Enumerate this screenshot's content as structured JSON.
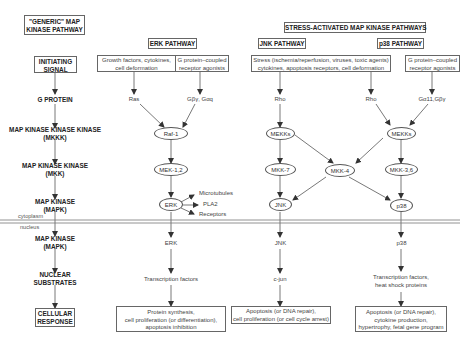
{
  "headers": {
    "generic": "\"GENERIC\" MAP\nKINASE PATHWAY",
    "generic_l1": "\"GENERIC\" MAP",
    "generic_l2": "KINASE PATHWAY",
    "stress": "STRESS-ACTIVATED MAP KINASE PATHWAYS",
    "erk": "ERK PATHWAY",
    "jnk": "JNK PATHWAY",
    "p38": "p38 PATHWAY"
  },
  "generic_steps": {
    "initiating_l1": "INITIATING",
    "initiating_l2": "SIGNAL",
    "g_protein": "G PROTEIN",
    "mkkk_l1": "MAP KINASE KINASE KINASE",
    "mkkk_l2": "(MKKK)",
    "mkk_l1": "MAP KINASE KINASE",
    "mkk_l2": "(MKK)",
    "mapk_l1": "MAP KINASE",
    "mapk_l2": "(MAPK)",
    "mapk2_l1": "MAP KINASE",
    "mapk2_l2": "(MAPK)",
    "nuclear_l1": "NUCLEAR",
    "nuclear_l2": "SUBSTRATES",
    "response_l1": "CELLULAR",
    "response_l2": "RESPONSE"
  },
  "compartments": {
    "cytoplasm": "cytoplasm",
    "nucleus": "nucleus"
  },
  "erk": {
    "signal1_l1": "Growth factors, cytokines,",
    "signal1_l2": "cell deformation",
    "signal2_l1": "G protein–coupled",
    "signal2_l2": "receptor agonists",
    "gprot1": "Ras",
    "gprot2": "Gβγ, Gαq",
    "mkkk": "Raf-1",
    "mkk": "MEK-1,2",
    "mapk": "ERK",
    "targets": [
      "Microtubules",
      "PLA2",
      "Receptors"
    ],
    "mapk_nuc": "ERK",
    "substrates": "Transcription factors",
    "response_l1": "Protein synthesis,",
    "response_l2": "cell proliferation (or differentiation),",
    "response_l3": "apoptosis inhibition"
  },
  "jnk": {
    "signal_l1": "Stress (ischemia/reperfusion, viruses, toxic agents)",
    "signal_l2": "cytokines, apoptosis receptors, cell deformation",
    "gprot": "Rho",
    "mkkk": "MEKKs",
    "mkk": "MKK-7",
    "mapk": "JNK",
    "mapk_nuc": "JNK",
    "substrates": "c-jun",
    "response_l1": "Apoptosis (or DNA repair),",
    "response_l2": "cell proliferation (or cell cycle arrest)"
  },
  "shared": {
    "mkk4": "MKK-4"
  },
  "p38": {
    "signal_l1": "G protein–coupled",
    "signal_l2": "receptor agonists",
    "gprot1": "Rho",
    "gprot2": "Gα11,Gβγ",
    "mkkk": "MEKKs",
    "mkk": "MKK-3,6",
    "mapk": "p38",
    "mapk_nuc": "p38",
    "substrates_l1": "Transcription factors,",
    "substrates_l2": "heat shock proteins",
    "response_l1": "Apoptosis (or DNA repair),",
    "response_l2": "cytokine production,",
    "response_l3": "hypertrophy, fetal gene program"
  }
}
